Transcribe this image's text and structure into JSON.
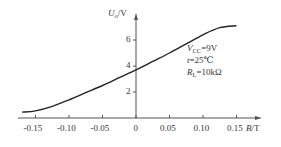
{
  "chart_data": {
    "type": "line",
    "title": "",
    "xlabel": "B/T",
    "ylabel": "U_o/V",
    "xlabel_parts": {
      "sym": "B",
      "unit": "/T"
    },
    "ylabel_parts": {
      "sym": "U",
      "sub": "o",
      "unit": "/V"
    },
    "x_ticks": [
      "-0.15",
      "-0.10",
      "-0.05",
      "0",
      "0.05",
      "0.10",
      "0.15"
    ],
    "y_ticks": [
      "2",
      "4",
      "6"
    ],
    "xlim": [
      -0.18,
      0.18
    ],
    "ylim": [
      0,
      7.5
    ],
    "grid": false,
    "series": [
      {
        "name": "Uo vs B",
        "x": [
          -0.17,
          -0.15,
          -0.125,
          -0.1,
          -0.075,
          -0.05,
          -0.025,
          0,
          0.025,
          0.05,
          0.075,
          0.1,
          0.125,
          0.15
        ],
        "y": [
          0.45,
          0.55,
          0.9,
          1.4,
          1.95,
          2.5,
          3.1,
          3.7,
          4.35,
          5.0,
          5.7,
          6.4,
          6.95,
          7.1
        ]
      }
    ],
    "annotations": [
      {
        "text": "VCC=9V",
        "sym": "V",
        "sub": "CC",
        "rest": "=9V"
      },
      {
        "text": "t=25℃",
        "sym": "t",
        "rest": "=25℃"
      },
      {
        "text": "RL=10kΩ",
        "sym": "R",
        "sub": "L",
        "rest": "=10kΩ"
      }
    ]
  }
}
